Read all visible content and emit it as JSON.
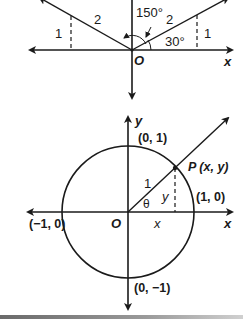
{
  "top_diagram": {
    "origin_label": "O",
    "x_axis_label": "x",
    "left_segment_label": "2",
    "right_segment_label": "2",
    "left_height_label": "1",
    "right_height_label": "1",
    "angle_large_label": "150°",
    "angle_small_label": "30°"
  },
  "unit_circle": {
    "origin_label": "O",
    "x_axis_label": "x",
    "y_axis_label": "y",
    "point_label": "P (x, y)",
    "radius_label": "1",
    "angle_label": "θ",
    "x_component_label": "x",
    "y_component_label": "y",
    "top_point_label": "(0, 1)",
    "right_point_label": "(1, 0)",
    "left_point_label": "(−1, 0)",
    "bottom_point_label": "(0, −1)"
  },
  "colors": {
    "ink": "#1a1a1a",
    "background": "#ffffff"
  }
}
